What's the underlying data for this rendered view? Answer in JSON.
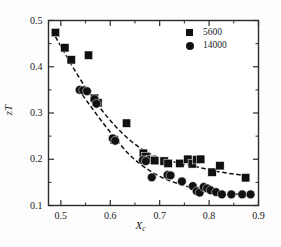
{
  "chart_data": {
    "type": "scatter",
    "title": "",
    "xlabel": "X",
    "xlabel_sub": "c",
    "ylabel": "zT",
    "xlim": [
      0.475,
      0.9
    ],
    "ylim": [
      0.1,
      0.5
    ],
    "grid": false,
    "legend_position": "top-right",
    "xticks": [
      0.5,
      0.6,
      0.7,
      0.8,
      0.9
    ],
    "xtick_labels": [
      "0.5",
      "0.6",
      "0.7",
      "0.8",
      "0.9"
    ],
    "xminor_ticks": [
      0.55,
      0.65,
      0.75,
      0.85
    ],
    "yticks": [
      0.1,
      0.2,
      0.3,
      0.4,
      0.5
    ],
    "ytick_labels": [
      "0.1",
      "0.2",
      "0.3",
      "0.4",
      "0.5"
    ],
    "yminor_ticks": [
      0.15,
      0.25,
      0.35,
      0.45
    ],
    "series": [
      {
        "name": "5600",
        "marker": "square",
        "color": "#111111",
        "points": [
          [
            0.489,
            0.474
          ],
          [
            0.508,
            0.441
          ],
          [
            0.521,
            0.415
          ],
          [
            0.556,
            0.425
          ],
          [
            0.568,
            0.332
          ],
          [
            0.575,
            0.322
          ],
          [
            0.608,
            0.242
          ],
          [
            0.633,
            0.278
          ],
          [
            0.667,
            0.213
          ],
          [
            0.672,
            0.206
          ],
          [
            0.681,
            0.199
          ],
          [
            0.69,
            0.197
          ],
          [
            0.709,
            0.196
          ],
          [
            0.717,
            0.191
          ],
          [
            0.741,
            0.191
          ],
          [
            0.757,
            0.2
          ],
          [
            0.766,
            0.19
          ],
          [
            0.775,
            0.199
          ],
          [
            0.783,
            0.2
          ],
          [
            0.806,
            0.172
          ],
          [
            0.822,
            0.186
          ],
          [
            0.874,
            0.16
          ]
        ],
        "fit_curve": [
          [
            0.489,
            0.465
          ],
          [
            0.52,
            0.407
          ],
          [
            0.55,
            0.355
          ],
          [
            0.58,
            0.31
          ],
          [
            0.61,
            0.272
          ],
          [
            0.64,
            0.241
          ],
          [
            0.67,
            0.218
          ],
          [
            0.7,
            0.203
          ],
          [
            0.73,
            0.194
          ],
          [
            0.76,
            0.187
          ],
          [
            0.79,
            0.18
          ],
          [
            0.82,
            0.173
          ],
          [
            0.85,
            0.168
          ],
          [
            0.88,
            0.164
          ]
        ]
      },
      {
        "name": "14000",
        "marker": "circle",
        "color": "#111111",
        "points": [
          [
            0.538,
            0.35
          ],
          [
            0.545,
            0.349
          ],
          [
            0.553,
            0.347
          ],
          [
            0.568,
            0.33
          ],
          [
            0.572,
            0.32
          ],
          [
            0.605,
            0.245
          ],
          [
            0.61,
            0.24
          ],
          [
            0.666,
            0.198
          ],
          [
            0.672,
            0.196
          ],
          [
            0.684,
            0.161
          ],
          [
            0.716,
            0.166
          ],
          [
            0.722,
            0.165
          ],
          [
            0.745,
            0.152
          ],
          [
            0.767,
            0.142
          ],
          [
            0.775,
            0.131
          ],
          [
            0.781,
            0.128
          ],
          [
            0.789,
            0.14
          ],
          [
            0.796,
            0.137
          ],
          [
            0.803,
            0.133
          ],
          [
            0.814,
            0.129
          ],
          [
            0.826,
            0.124
          ],
          [
            0.845,
            0.124
          ],
          [
            0.867,
            0.124
          ],
          [
            0.884,
            0.124
          ]
        ],
        "fit_curve": [
          [
            0.535,
            0.352
          ],
          [
            0.56,
            0.315
          ],
          [
            0.585,
            0.279
          ],
          [
            0.61,
            0.245
          ],
          [
            0.635,
            0.214
          ],
          [
            0.66,
            0.19
          ],
          [
            0.685,
            0.172
          ],
          [
            0.71,
            0.158
          ],
          [
            0.735,
            0.148
          ],
          [
            0.76,
            0.14
          ],
          [
            0.79,
            0.133
          ],
          [
            0.82,
            0.128
          ],
          [
            0.85,
            0.125
          ],
          [
            0.885,
            0.123
          ]
        ]
      }
    ],
    "legend": [
      {
        "label": "5600",
        "marker": "square"
      },
      {
        "label": "14000",
        "marker": "circle"
      }
    ]
  }
}
